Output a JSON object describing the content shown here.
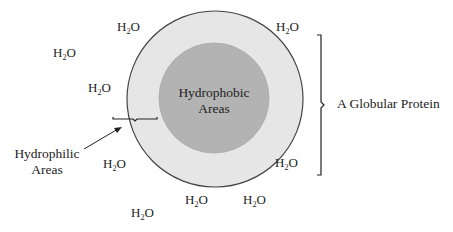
{
  "diagram": {
    "title": "A Globular Protein",
    "colors": {
      "outer_fill": "#e6e6e6",
      "outer_stroke": "#444444",
      "inner_fill": "#b3b3b3",
      "line": "#222222"
    },
    "outer_circle": {
      "cx": 215,
      "cy": 99,
      "r": 88
    },
    "inner_circle": {
      "cx": 214,
      "cy": 98,
      "r": 55
    },
    "labels": {
      "core_line1": "Hydrophobic",
      "core_line2": "Areas",
      "surface_line1": "Hydrophilic",
      "surface_line2": "Areas",
      "protein": "A Globular Protein"
    },
    "water": {
      "symbol_h": "H",
      "symbol_sub": "2",
      "symbol_o": "O",
      "molecules": [
        {
          "x": 117,
          "y": 20
        },
        {
          "x": 276,
          "y": 20
        },
        {
          "x": 53,
          "y": 46
        },
        {
          "x": 88,
          "y": 81
        },
        {
          "x": 103,
          "y": 157
        },
        {
          "x": 275,
          "y": 156
        },
        {
          "x": 185,
          "y": 193
        },
        {
          "x": 243,
          "y": 193
        },
        {
          "x": 131,
          "y": 206
        }
      ]
    }
  }
}
